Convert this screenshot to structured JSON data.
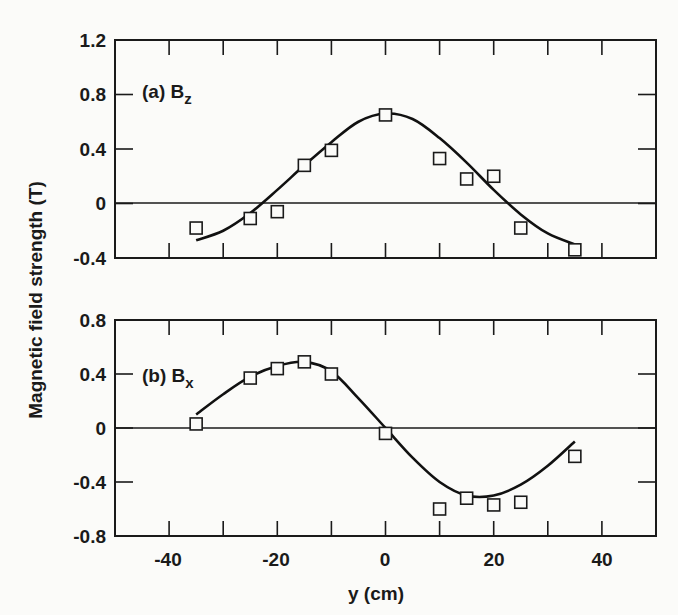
{
  "chart_data": [
    {
      "type": "scatter",
      "panel_label": "(a) B",
      "panel_sub": "z",
      "xlabel": "y (cm)",
      "ylabel": "Magnetic field strength (T)",
      "xlim": [
        -50,
        50
      ],
      "ylim": [
        -0.4,
        1.2
      ],
      "yticks": [
        1.2,
        0.8,
        0.4,
        0,
        -0.4
      ],
      "ytick_labels": [
        "1.2",
        "0.8",
        "0.4",
        "0",
        "-0.4"
      ],
      "xticks": [
        -40,
        -30,
        -20,
        -10,
        0,
        10,
        20,
        30,
        40
      ],
      "series": [
        {
          "name": "measured",
          "marker": "open-square",
          "x": [
            -35,
            -25,
            -20,
            -15,
            -10,
            0,
            10,
            15,
            20,
            25,
            35
          ],
          "y": [
            -0.18,
            -0.11,
            -0.06,
            0.28,
            0.39,
            0.65,
            0.33,
            0.18,
            0.2,
            -0.18,
            -0.34
          ]
        },
        {
          "name": "fit",
          "style": "line",
          "x": [
            -35,
            -30,
            -25,
            -20,
            -15,
            -10,
            -5,
            0,
            5,
            10,
            15,
            20,
            25,
            30,
            35
          ],
          "y": [
            -0.27,
            -0.2,
            -0.07,
            0.1,
            0.28,
            0.45,
            0.6,
            0.66,
            0.62,
            0.48,
            0.3,
            0.1,
            -0.08,
            -0.22,
            -0.3
          ]
        }
      ],
      "grid": false
    },
    {
      "type": "scatter",
      "panel_label": "(b) B",
      "panel_sub": "x",
      "xlabel": "y (cm)",
      "ylabel": "Magnetic field strength (T)",
      "xlim": [
        -50,
        50
      ],
      "ylim": [
        -0.8,
        0.8
      ],
      "yticks": [
        0.8,
        0.4,
        0,
        -0.4,
        -0.8
      ],
      "ytick_labels": [
        "0.8",
        "0.4",
        "0",
        "-0.4",
        "-0.8"
      ],
      "xticks": [
        -40,
        -30,
        -20,
        -10,
        0,
        10,
        20,
        30,
        40
      ],
      "xtick_labels": [
        "-40",
        "-20",
        "0",
        "20",
        "40"
      ],
      "series": [
        {
          "name": "measured",
          "marker": "open-square",
          "x": [
            -35,
            -25,
            -20,
            -15,
            -10,
            0,
            10,
            15,
            20,
            25,
            35
          ],
          "y": [
            0.03,
            0.37,
            0.44,
            0.49,
            0.4,
            -0.04,
            -0.6,
            -0.52,
            -0.57,
            -0.55,
            -0.21
          ]
        },
        {
          "name": "fit",
          "style": "line",
          "x": [
            -35,
            -30,
            -25,
            -20,
            -15,
            -10,
            -5,
            0,
            5,
            10,
            15,
            20,
            25,
            30,
            35
          ],
          "y": [
            0.1,
            0.25,
            0.38,
            0.46,
            0.49,
            0.42,
            0.22,
            0.0,
            -0.22,
            -0.4,
            -0.5,
            -0.5,
            -0.42,
            -0.28,
            -0.1
          ]
        }
      ],
      "grid": false
    }
  ],
  "labels": {
    "ylabel": "Magnetic field strength (T)",
    "xlabel": "y (cm)",
    "panel_a": "(a) B",
    "panel_a_sub": "z",
    "panel_b": "(b) B",
    "panel_b_sub": "x",
    "x_ticks": [
      "-40",
      "-20",
      "0",
      "20",
      "40"
    ],
    "a_ticks": [
      "1.2",
      "0.8",
      "0.4",
      "0",
      "-0.4"
    ],
    "b_ticks": [
      "0.8",
      "0.4",
      "0",
      "-0.4",
      "-0.8"
    ]
  }
}
